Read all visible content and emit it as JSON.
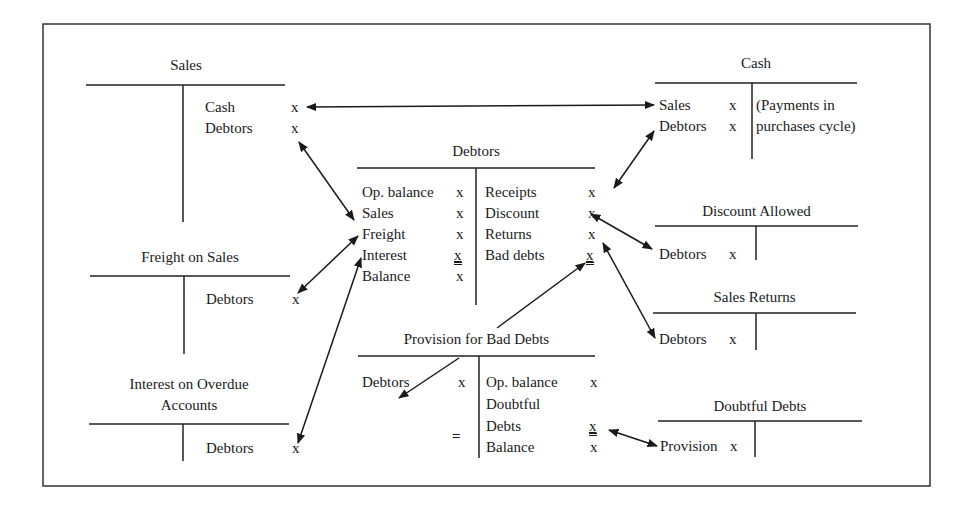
{
  "diagram": {
    "accounts": {
      "sales": {
        "title": "Sales",
        "debit": [],
        "credit": [
          {
            "label": "Cash",
            "amount": "x"
          },
          {
            "label": "Debtors",
            "amount": "x"
          }
        ]
      },
      "cash": {
        "title": "Cash",
        "debit": [
          {
            "label": "Sales",
            "amount": "x"
          },
          {
            "label": "Debtors",
            "amount": "x"
          }
        ],
        "credit_note_line1": "(Payments in",
        "credit_note_line2": "purchases cycle)"
      },
      "debtors": {
        "title": "Debtors",
        "debit": [
          {
            "label": "Op. balance",
            "amount": "x"
          },
          {
            "label": "Sales",
            "amount": "x"
          },
          {
            "label": "Freight",
            "amount": "x"
          },
          {
            "label": "Interest",
            "amount": "x"
          },
          {
            "label": "Balance",
            "amount": "x"
          }
        ],
        "credit": [
          {
            "label": "Receipts",
            "amount": "x"
          },
          {
            "label": "Discount",
            "amount": "x"
          },
          {
            "label": "Returns",
            "amount": "x"
          },
          {
            "label": "Bad debts",
            "amount": "x"
          }
        ]
      },
      "freight_on_sales": {
        "title": "Freight on Sales",
        "credit": [
          {
            "label": "Debtors",
            "amount": "x"
          }
        ]
      },
      "interest_on_overdue": {
        "title_line1": "Interest on Overdue",
        "title_line2": "Accounts",
        "credit": [
          {
            "label": "Debtors",
            "amount": "x"
          }
        ]
      },
      "discount_allowed": {
        "title": "Discount Allowed",
        "debit": [
          {
            "label": "Debtors",
            "amount": "x"
          }
        ]
      },
      "sales_returns": {
        "title": "Sales Returns",
        "debit": [
          {
            "label": "Debtors",
            "amount": "x"
          }
        ]
      },
      "provision_bad_debts": {
        "title": "Provision for Bad Debts",
        "debit": [
          {
            "label": "Debtors",
            "amount": "x"
          }
        ],
        "debit_total_mark": "=",
        "credit": [
          {
            "label": "Op. balance",
            "amount": "x"
          },
          {
            "label": "Doubtful",
            "amount": ""
          },
          {
            "label": "Debts",
            "amount": "x"
          },
          {
            "label": "Balance",
            "amount": "x"
          }
        ]
      },
      "doubtful_debts": {
        "title": "Doubtful Debts",
        "debit": [
          {
            "label": "Provision",
            "amount": "x"
          }
        ]
      }
    },
    "connections": [
      {
        "from": "sales.credit.cash",
        "to": "cash.debit.sales",
        "type": "double-arrow"
      },
      {
        "from": "sales.credit.debtors",
        "to": "debtors.debit.sales",
        "type": "double-arrow"
      },
      {
        "from": "freight_on_sales.credit.debtors",
        "to": "debtors.debit.freight",
        "type": "double-arrow"
      },
      {
        "from": "interest_on_overdue.credit.debtors",
        "to": "debtors.debit.interest",
        "type": "double-arrow"
      },
      {
        "from": "cash.debit.debtors",
        "to": "debtors.credit.receipts",
        "type": "double-arrow"
      },
      {
        "from": "debtors.credit.discount",
        "to": "discount_allowed.debit.debtors",
        "type": "double-arrow"
      },
      {
        "from": "debtors.credit.returns",
        "to": "sales_returns.debit.debtors",
        "type": "double-arrow"
      },
      {
        "from": "provision_bad_debts.title",
        "to": "debtors.credit.bad_debts",
        "type": "arrow"
      },
      {
        "from": "provision_bad_debts.title",
        "to": "provision_bad_debts.debit.debtors",
        "type": "arrow"
      },
      {
        "from": "provision_bad_debts.credit.debts",
        "to": "doubtful_debts.debit.provision",
        "type": "double-arrow"
      }
    ]
  }
}
